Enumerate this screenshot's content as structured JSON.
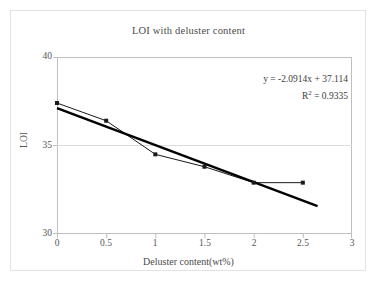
{
  "chart_data": {
    "type": "line",
    "title": "LOI with deluster content",
    "xlabel": "Deluster content(wt%)",
    "ylabel": "LOI",
    "xlim": [
      0,
      3
    ],
    "ylim": [
      30,
      40
    ],
    "xticks": [
      "0",
      "0.5",
      "1",
      "1.5",
      "2",
      "2.5",
      "3"
    ],
    "xtick_values": [
      0,
      0.5,
      1,
      1.5,
      2,
      2.5,
      3
    ],
    "yticks": [
      "30",
      "35",
      "40"
    ],
    "ytick_values": [
      30,
      35,
      40
    ],
    "grid": "horizontal-at-35",
    "legend": "none",
    "series": [
      {
        "name": "LOI",
        "marker": "filled-square",
        "color": "#1a1a1a",
        "x": [
          0,
          0.5,
          1,
          1.5,
          2,
          2.5
        ],
        "values": [
          37.4,
          36.4,
          34.5,
          33.8,
          32.9,
          32.9
        ]
      },
      {
        "name": "Linear trendline",
        "type": "trendline",
        "color": "#000000",
        "x": [
          0,
          2.65
        ],
        "values": [
          37.114,
          31.57
        ]
      }
    ],
    "annotations": {
      "equation": "y = -2.0914x + 37.114",
      "r_squared_prefix": "R",
      "r_squared_exp": "2",
      "r_squared_value": " = 0.9335",
      "r_squared_full": "R2 = 0.9335"
    },
    "trendline_fit": {
      "slope": -2.0914,
      "intercept": 37.114,
      "r_squared": 0.9335
    }
  },
  "colors": {
    "plot_border": "#bfbfbf",
    "outer_frame": "#e2e2e2",
    "gridline": "#dcdcdc",
    "text": "#555555",
    "series_line": "#1a1a1a",
    "trendline": "#000000"
  }
}
